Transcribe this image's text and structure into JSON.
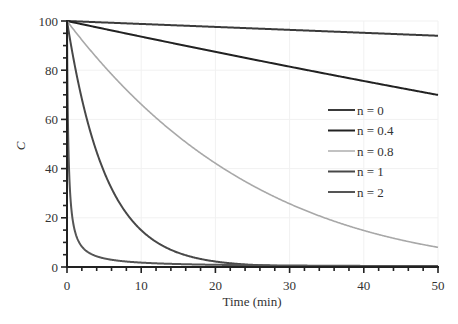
{
  "chart_data": {
    "type": "line",
    "title": "",
    "xlabel": "Time (min)",
    "ylabel": "C",
    "xlim": [
      0,
      50
    ],
    "ylim": [
      0,
      100
    ],
    "xticks": [
      0,
      10,
      20,
      30,
      40,
      50
    ],
    "yticks": [
      0,
      20,
      40,
      60,
      80,
      100
    ],
    "x_minor_step": 2,
    "y_minor_step": 5,
    "grid": "faint vertical and horizontal",
    "legend_position": "center-right",
    "series": [
      {
        "name": "n = 0",
        "color": "#3a3a3a",
        "order": 0,
        "initial": 100,
        "k": 0.12,
        "points": [
          [
            0,
            100
          ],
          [
            10,
            98.8
          ],
          [
            20,
            97.6
          ],
          [
            30,
            96.4
          ],
          [
            40,
            95.2
          ],
          [
            50,
            94
          ]
        ]
      },
      {
        "name": "n = 0.4",
        "color": "#222222",
        "order": 0.4,
        "initial": 100,
        "k": 0.102,
        "points": [
          [
            0,
            100
          ],
          [
            10,
            94.1
          ],
          [
            20,
            88.2
          ],
          [
            30,
            82.2
          ],
          [
            40,
            76.1
          ],
          [
            50,
            70
          ]
        ]
      },
      {
        "name": "n = 0.8",
        "color": "#a8a8a8",
        "order": 0.8,
        "initial": 100,
        "k": 0.0996,
        "points": [
          [
            0,
            100
          ],
          [
            10,
            64.5
          ],
          [
            20,
            42.3
          ],
          [
            30,
            25.7
          ],
          [
            40,
            14.6
          ],
          [
            50,
            8
          ]
        ]
      },
      {
        "name": "n = 1",
        "color": "#484848",
        "order": 1,
        "initial": 100,
        "k": 0.19,
        "points": [
          [
            0,
            100
          ],
          [
            5,
            38.7
          ],
          [
            10,
            15
          ],
          [
            20,
            2.2
          ],
          [
            30,
            0.3
          ],
          [
            50,
            0
          ]
        ]
      },
      {
        "name": "n = 2",
        "color": "#555555",
        "order": 2,
        "initial": 100,
        "k": 0.055,
        "points": [
          [
            0,
            100
          ],
          [
            1,
            15.4
          ],
          [
            2,
            8.3
          ],
          [
            5,
            3.5
          ],
          [
            10,
            1.8
          ],
          [
            50,
            0.4
          ]
        ]
      }
    ]
  }
}
